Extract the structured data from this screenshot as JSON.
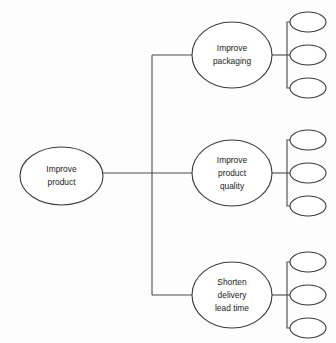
{
  "diagram": {
    "type": "tree-diagram",
    "background_color": "#fdfdfd",
    "line_color": "#4a4a4a",
    "node_fill": "#ffffff",
    "node_stroke": "#3a3a3a",
    "text_color": "#1a1a1a",
    "root": {
      "id": "root",
      "label_lines": [
        "Improve",
        "product"
      ],
      "line1": "Improve",
      "line2": "product",
      "cx": 61.5,
      "cy": 176,
      "rx": 41.5,
      "ry": 29
    },
    "branches": [
      {
        "id": "branch-improve-packaging",
        "label_lines": [
          "Improve",
          "packaging"
        ],
        "line1": "Improve",
        "line2": "packaging",
        "line3": "",
        "cx": 232,
        "cy": 55,
        "rx": 40,
        "ry": 33,
        "leaf_count": 3
      },
      {
        "id": "branch-improve-product-quality",
        "label_lines": [
          "Improve",
          "product",
          "quality"
        ],
        "line1": "Improve",
        "line2": "product",
        "line3": "quality",
        "cx": 232,
        "cy": 173,
        "rx": 40,
        "ry": 33,
        "leaf_count": 3
      },
      {
        "id": "branch-shorten-delivery-lead-time",
        "label_lines": [
          "Shorten",
          "delivery",
          "lead time"
        ],
        "line1": "Shorten",
        "line2": "delivery",
        "line3": "lead time",
        "cx": 232,
        "cy": 295,
        "rx": 40,
        "ry": 33,
        "leaf_count": 3
      }
    ],
    "leaf_groups": [
      {
        "id": "leaf-group-packaging",
        "parent": "branch-improve-packaging",
        "bracket_x": 287,
        "leaves": [
          {
            "id": "leaf-packaging-1",
            "label": "",
            "cx": 308,
            "cy": 22,
            "rx": 18,
            "ry": 10
          },
          {
            "id": "leaf-packaging-2",
            "label": "",
            "cx": 308,
            "cy": 55,
            "rx": 18,
            "ry": 10
          },
          {
            "id": "leaf-packaging-3",
            "label": "",
            "cx": 308,
            "cy": 88,
            "rx": 18,
            "ry": 10
          }
        ]
      },
      {
        "id": "leaf-group-quality",
        "parent": "branch-improve-product-quality",
        "bracket_x": 287,
        "leaves": [
          {
            "id": "leaf-quality-1",
            "label": "",
            "cx": 308,
            "cy": 140,
            "rx": 18,
            "ry": 10
          },
          {
            "id": "leaf-quality-2",
            "label": "",
            "cx": 308,
            "cy": 173,
            "rx": 18,
            "ry": 10
          },
          {
            "id": "leaf-quality-3",
            "label": "",
            "cx": 308,
            "cy": 206,
            "rx": 18,
            "ry": 10
          }
        ]
      },
      {
        "id": "leaf-group-delivery",
        "parent": "branch-shorten-delivery-lead-time",
        "bracket_x": 287,
        "leaves": [
          {
            "id": "leaf-delivery-1",
            "label": "",
            "cx": 308,
            "cy": 262,
            "rx": 18,
            "ry": 10
          },
          {
            "id": "leaf-delivery-2",
            "label": "",
            "cx": 308,
            "cy": 295,
            "rx": 18,
            "ry": 10
          },
          {
            "id": "leaf-delivery-3",
            "label": "",
            "cx": 308,
            "cy": 328,
            "rx": 18,
            "ry": 10
          }
        ]
      }
    ],
    "connectors": {
      "root_spine": "M103,173 L192,173",
      "trunk_vertical": "M152,55 L152,295",
      "trunk_stub_top": "M152,55 L192,55",
      "trunk_stub_bottom": "M152,295 L192,295",
      "branch_stub_top": "M272,55 L287,55",
      "branch_stub_middle": "M272,173 L287,173",
      "branch_stub_bottom": "M272,295 L287,295",
      "bracket_packaging": "M290,22 L287,22 L287,88 L290,88",
      "bracket_packaging_middle": "M287,55 L290,55",
      "bracket_quality": "M290,140 L287,140 L287,206 L290,206",
      "bracket_quality_middle": "M287,173 L290,173",
      "bracket_delivery": "M290,262 L287,262 L287,328 L290,328",
      "bracket_delivery_middle": "M287,295 L290,295"
    }
  }
}
